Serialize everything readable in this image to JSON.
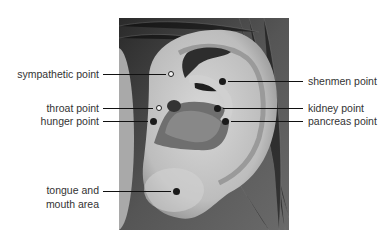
{
  "figure": {
    "points": [
      {
        "id": "sympathetic",
        "label": "sympathetic point",
        "side": "left",
        "marker": "open"
      },
      {
        "id": "throat",
        "label": "throat point",
        "side": "left",
        "marker": "open"
      },
      {
        "id": "hunger",
        "label": "hunger point",
        "side": "left",
        "marker": "filled"
      },
      {
        "id": "tongue",
        "label_line1": "tongue and",
        "label_line2": "mouth area",
        "side": "left",
        "marker": "filled"
      },
      {
        "id": "shenmen",
        "label": "shenmen point",
        "side": "right",
        "marker": "filled"
      },
      {
        "id": "kidney",
        "label": "kidney point",
        "side": "right",
        "marker": "filled"
      },
      {
        "id": "pancreas",
        "label": "pancreas point",
        "side": "right",
        "marker": "filled"
      }
    ]
  },
  "colors": {
    "background": "#ffffff",
    "label_text": "#333333",
    "leader_line": "#111111",
    "marker": "#1a1a1a"
  }
}
